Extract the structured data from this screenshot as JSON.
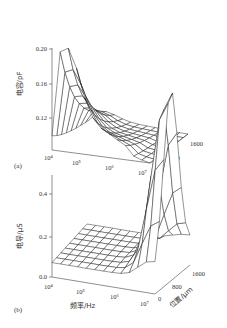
{
  "chart_data": [
    {
      "type": "surface",
      "panel_label": "(a)",
      "title": "",
      "zlabel": "电容/pF",
      "xlabel": "",
      "ylabel": "",
      "x_ticks": [
        "10⁴",
        "10⁵",
        "10⁶",
        "10⁷"
      ],
      "y_ticks": [
        "0",
        "800",
        "1600"
      ],
      "z_ticks": [
        "0.12",
        "0.16",
        "0.20"
      ],
      "zlim": [
        0.1,
        0.21
      ],
      "x_log_range": [
        4,
        7
      ],
      "y_range": [
        0,
        1600
      ],
      "description": "Capacitance peaks ~0.21 pF at low frequency (10^4 Hz) near position 0, decays with frequency to ~0.10 pF at 10^7 Hz; small ridge around 10^6 Hz",
      "grid": {
        "x": [
          4.0,
          4.25,
          4.5,
          4.75,
          5.0,
          5.25,
          5.5,
          5.75,
          6.0,
          6.25,
          6.5,
          6.75,
          7.0
        ],
        "y": [
          0,
          200,
          400,
          600,
          800,
          1000,
          1200,
          1400,
          1600
        ],
        "z_peak_at_y0": [
          0.115,
          0.205,
          0.21,
          0.19,
          0.16,
          0.14,
          0.13,
          0.125,
          0.12,
          0.115,
          0.105,
          0.102,
          0.1
        ],
        "z_at_y1600": [
          0.1,
          0.1,
          0.1,
          0.1,
          0.1,
          0.1,
          0.1,
          0.1,
          0.1,
          0.1,
          0.1,
          0.1,
          0.1
        ]
      }
    },
    {
      "type": "surface",
      "panel_label": "(b)",
      "title": "",
      "zlabel": "电导/μS",
      "xlabel": "频率/Hz",
      "ylabel": "位置/μm",
      "x_ticks": [
        "10⁴",
        "10⁵",
        "10⁶",
        "10⁷"
      ],
      "y_ticks": [
        "0",
        "800",
        "1600"
      ],
      "z_ticks": [
        "0.0",
        "0.2",
        "0.4"
      ],
      "zlim": [
        0.0,
        0.5
      ],
      "x_log_range": [
        4,
        7
      ],
      "y_range": [
        0,
        1600
      ],
      "description": "Conductance flat ~0.05–0.1 μS at low frequency, rises sharply above 10^6 Hz to peak ~0.5 μS at 10^7 Hz, position ~800 μm",
      "grid": {
        "x": [
          4.0,
          4.25,
          4.5,
          4.75,
          5.0,
          5.25,
          5.5,
          5.75,
          6.0,
          6.25,
          6.5,
          6.75,
          7.0
        ],
        "y": [
          0,
          200,
          400,
          600,
          800,
          1000,
          1200,
          1400,
          1600
        ],
        "z_low_freq": 0.06,
        "z_peak": 0.5
      }
    }
  ]
}
